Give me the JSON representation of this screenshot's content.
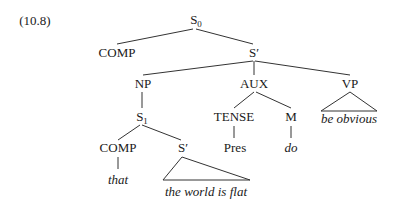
{
  "example_number": "(10.8)",
  "nodes": {
    "s0": {
      "label": "S",
      "sub": "0"
    },
    "comp_top": {
      "label": "COMP"
    },
    "s_bar_top": {
      "label": "S′"
    },
    "np": {
      "label": "NP"
    },
    "aux": {
      "label": "AUX"
    },
    "vp": {
      "label": "VP"
    },
    "s1": {
      "label": "S",
      "sub": "1"
    },
    "tense": {
      "label": "TENSE"
    },
    "m": {
      "label": "M"
    },
    "comp_low": {
      "label": "COMP"
    },
    "s_bar_low": {
      "label": "S′"
    },
    "pres": {
      "label": "Pres"
    },
    "do": {
      "label": "do"
    },
    "that": {
      "label": "that"
    },
    "world_flat": {
      "label": "the world is flat"
    },
    "be_obvious": {
      "label": "be obvious"
    }
  },
  "colors": {
    "ink": "#1a1a1a",
    "lines": "#333333",
    "background": "#ffffff"
  }
}
